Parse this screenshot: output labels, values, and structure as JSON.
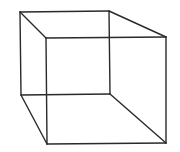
{
  "diagram": {
    "stroke_color": "#2a2a2a",
    "background": "#ffffff",
    "stroke_width": 1.4,
    "vertices": {
      "back_top_left": [
        20,
        12
      ],
      "back_top_right": [
        109,
        11
      ],
      "back_bottom_left": [
        21,
        95
      ],
      "back_bottom_right": [
        110,
        94
      ],
      "front_top_left": [
        46,
        38
      ],
      "front_top_right": [
        166,
        37
      ],
      "front_bottom_left": [
        47,
        144
      ],
      "front_bottom_right": [
        166,
        143
      ]
    },
    "edges": [
      [
        "back_top_left",
        "back_top_right"
      ],
      [
        "back_top_right",
        "back_bottom_right"
      ],
      [
        "back_bottom_right",
        "back_bottom_left"
      ],
      [
        "back_bottom_left",
        "back_top_left"
      ],
      [
        "front_top_left",
        "front_top_right"
      ],
      [
        "front_top_right",
        "front_bottom_right"
      ],
      [
        "front_bottom_right",
        "front_bottom_left"
      ],
      [
        "front_bottom_left",
        "front_top_left"
      ],
      [
        "back_top_left",
        "front_top_left"
      ],
      [
        "back_top_right",
        "front_top_right"
      ],
      [
        "back_bottom_left",
        "front_bottom_left"
      ],
      [
        "back_bottom_right",
        "front_bottom_right"
      ]
    ]
  }
}
